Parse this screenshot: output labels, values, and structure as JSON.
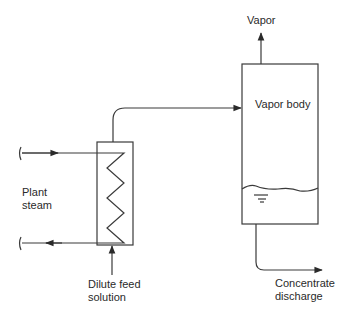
{
  "diagram": {
    "type": "process-flow",
    "title": "",
    "colors": {
      "line": "#3a3a3a",
      "background": "#ffffff"
    },
    "labels": {
      "vapor": "Vapor",
      "vapor_body": "Vapor body",
      "plant_steam_line1": "Plant",
      "plant_steam_line2": "steam",
      "dilute_feed_line1": "Dilute feed",
      "dilute_feed_line2": "solution",
      "concentrate_line1": "Concentrate",
      "concentrate_line2": "discharge"
    },
    "nodes": [
      {
        "id": "heat-exchanger",
        "label": "Heat exchanger (coil)"
      },
      {
        "id": "vapor-body",
        "label": "Vapor body"
      }
    ],
    "edges": [
      {
        "from": "plant-steam-in",
        "to": "heat-exchanger"
      },
      {
        "from": "heat-exchanger",
        "to": "plant-steam-out"
      },
      {
        "from": "dilute-feed",
        "to": "heat-exchanger"
      },
      {
        "from": "heat-exchanger",
        "to": "vapor-body"
      },
      {
        "from": "vapor-body",
        "to": "vapor-out",
        "label": "Vapor"
      },
      {
        "from": "vapor-body",
        "to": "concentrate-out",
        "label": "Concentrate discharge"
      }
    ]
  }
}
